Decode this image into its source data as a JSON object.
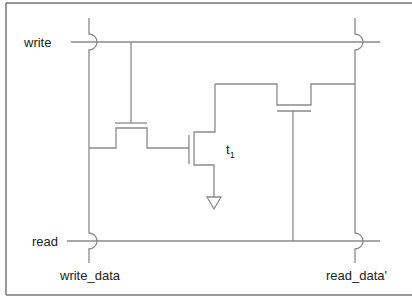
{
  "diagram": {
    "labels": {
      "write": "write",
      "read": "read",
      "write_data": "write_data",
      "read_data": "read_data'",
      "transistor_name": "t",
      "transistor_subscript": "1"
    },
    "colors": {
      "wire": "#8a8a8a",
      "frame": "#777777",
      "text": "#222222",
      "background": "#ffffff"
    },
    "nodes": {
      "write_line_y": 42,
      "read_line_y": 241,
      "write_data_x": 89,
      "read_data_x": 355
    }
  }
}
